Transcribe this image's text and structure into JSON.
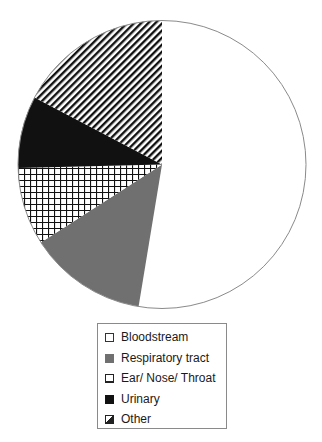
{
  "chart_data": {
    "type": "pie",
    "title": "",
    "categories": [
      "Bloodstream",
      "Respiratory tract",
      "Ear/ Nose/ Throat",
      "Urinary",
      "Other"
    ],
    "values": [
      52.6,
      13.3,
      8.7,
      8.1,
      17.3
    ],
    "unit": "percent (estimated from slice angles)",
    "start_angle_deg": 0,
    "direction": "clockwise",
    "legend_position": "bottom",
    "fills": [
      {
        "name": "Bloodstream",
        "fill": "white"
      },
      {
        "name": "Respiratory tract",
        "fill": "solid-gray"
      },
      {
        "name": "Ear/ Nose/ Throat",
        "fill": "grid-hatch"
      },
      {
        "name": "Urinary",
        "fill": "solid-black"
      },
      {
        "name": "Other",
        "fill": "diagonal-hatch"
      }
    ]
  },
  "colors": {
    "outline": "#8a8a8a",
    "gray": "#707070",
    "black": "#111111",
    "white": "#ffffff"
  },
  "legend": {
    "items": [
      {
        "label": "Bloodstream",
        "swatch": "white"
      },
      {
        "label": "Respiratory tract",
        "swatch": "gray"
      },
      {
        "label": "Ear/ Nose/ Throat",
        "swatch": "grid"
      },
      {
        "label": "Urinary",
        "swatch": "black"
      },
      {
        "label": "Other",
        "swatch": "diagonal"
      }
    ]
  }
}
